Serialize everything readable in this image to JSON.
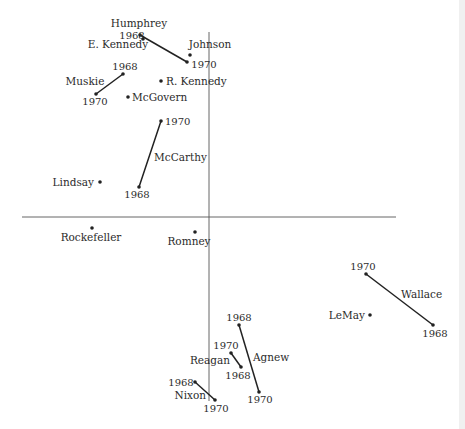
{
  "figure": {
    "axes": {
      "vertical": {
        "x": 209,
        "y1": 32,
        "y2": 401
      },
      "horizontal": {
        "y": 217,
        "x1": 22,
        "x2": 396
      }
    }
  },
  "chart_data": {
    "type": "scatter",
    "title": "",
    "xlabel": "",
    "ylabel": "",
    "grid": false,
    "legend": "none",
    "axes_origin_px": {
      "x": 209,
      "y": 217
    },
    "points": [
      {
        "name": "E. Kennedy",
        "label": "E. Kennedy",
        "x": 143,
        "y": 39,
        "lx": 118,
        "ly": 48,
        "anchor": "middle"
      },
      {
        "name": "Johnson",
        "label": "Johnson",
        "x": 190,
        "y": 55,
        "lx": 210,
        "ly": 48,
        "anchor": "middle"
      },
      {
        "name": "R. Kennedy",
        "label": "R. Kennedy",
        "x": 161,
        "y": 81,
        "lx": 166,
        "ly": 85,
        "anchor": "start"
      },
      {
        "name": "McGovern",
        "label": "McGovern",
        "x": 128,
        "y": 97,
        "lx": 132,
        "ly": 101,
        "anchor": "start"
      },
      {
        "name": "Lindsay",
        "label": "Lindsay",
        "x": 100,
        "y": 182,
        "lx": 94,
        "ly": 186,
        "anchor": "end"
      },
      {
        "name": "Rockefeller",
        "label": "Rockefeller",
        "x": 92,
        "y": 228,
        "lx": 91,
        "ly": 241,
        "anchor": "middle"
      },
      {
        "name": "Romney",
        "label": "Romney",
        "x": 195,
        "y": 232,
        "lx": 189,
        "ly": 245,
        "anchor": "middle"
      },
      {
        "name": "LeMay",
        "label": "LeMay",
        "x": 370,
        "y": 315,
        "lx": 365,
        "ly": 319,
        "anchor": "end"
      }
    ],
    "trajectories": [
      {
        "name": "Humphrey",
        "label": "Humphrey",
        "lx": 139,
        "ly": 27,
        "anchor": "middle",
        "from": {
          "year": "1968",
          "x": 140,
          "y": 35,
          "lx": 132,
          "ly": 39,
          "anchor": "middle"
        },
        "to": {
          "year": "1970",
          "x": 187,
          "y": 62,
          "lx": 204,
          "ly": 68,
          "anchor": "middle"
        }
      },
      {
        "name": "Muskie",
        "label": "Muskie",
        "lx": 85,
        "ly": 85,
        "anchor": "middle",
        "from": {
          "year": "1968",
          "x": 123,
          "y": 74,
          "lx": 125,
          "ly": 70,
          "anchor": "middle"
        },
        "to": {
          "year": "1970",
          "x": 96,
          "y": 94,
          "lx": 95,
          "ly": 105,
          "anchor": "middle"
        }
      },
      {
        "name": "McCarthy",
        "label": "McCarthy",
        "lx": 154,
        "ly": 161,
        "anchor": "start",
        "from": {
          "year": "1968",
          "x": 139,
          "y": 187,
          "lx": 137,
          "ly": 198,
          "anchor": "middle"
        },
        "to": {
          "year": "1970",
          "x": 161,
          "y": 121,
          "lx": 165,
          "ly": 125,
          "anchor": "start"
        }
      },
      {
        "name": "Wallace",
        "label": "Wallace",
        "lx": 401,
        "ly": 298,
        "anchor": "start",
        "from": {
          "year": "1968",
          "x": 433,
          "y": 325,
          "lx": 435,
          "ly": 337,
          "anchor": "middle"
        },
        "to": {
          "year": "1970",
          "x": 366,
          "y": 274,
          "lx": 363,
          "ly": 270,
          "anchor": "middle"
        }
      },
      {
        "name": "Agnew",
        "label": "Agnew",
        "lx": 253,
        "ly": 361,
        "anchor": "start",
        "from": {
          "year": "1968",
          "x": 239,
          "y": 325,
          "lx": 239,
          "ly": 321,
          "anchor": "middle"
        },
        "to": {
          "year": "1970",
          "x": 259,
          "y": 392,
          "lx": 260,
          "ly": 403,
          "anchor": "middle"
        }
      },
      {
        "name": "Reagan",
        "label": "Reagan",
        "lx": 230,
        "ly": 364,
        "anchor": "end",
        "from": {
          "year": "1968",
          "x": 241,
          "y": 367,
          "lx": 238,
          "ly": 379,
          "anchor": "middle"
        },
        "to": {
          "year": "1970",
          "x": 231,
          "y": 353,
          "lx": 226,
          "ly": 349,
          "anchor": "middle"
        }
      },
      {
        "name": "Nixon",
        "label": "Nixon",
        "lx": 206,
        "ly": 399,
        "anchor": "end",
        "from": {
          "year": "1968",
          "x": 195,
          "y": 382,
          "lx": 181,
          "ly": 386,
          "anchor": "middle"
        },
        "to": {
          "year": "1970",
          "x": 215,
          "y": 400,
          "lx": 216,
          "ly": 412,
          "anchor": "middle"
        }
      }
    ]
  }
}
